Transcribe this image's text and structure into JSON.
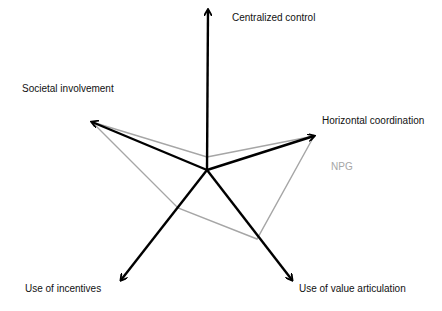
{
  "diagram": {
    "type": "radar-arrow-diagram",
    "center": [
      207,
      170
    ],
    "axes": [
      {
        "id": "centralized-control",
        "label": "Centralized control",
        "tip": [
          208,
          10
        ],
        "label_pos": [
          232,
          12
        ]
      },
      {
        "id": "horizontal-coordination",
        "label": "Horizontal coordination",
        "tip": [
          314,
          136
        ],
        "label_pos": [
          322,
          115
        ]
      },
      {
        "id": "use-of-value-articulation",
        "label": "Use of value articulation",
        "tip": [
          292,
          280
        ],
        "label_pos": [
          299,
          283
        ]
      },
      {
        "id": "use-of-incentives",
        "label": "Use of incentives",
        "tip": [
          121,
          280
        ],
        "label_pos": [
          25,
          283
        ]
      },
      {
        "id": "societal-involvement",
        "label": "Societal involvement",
        "tip": [
          92,
          122
        ],
        "label_pos": [
          22,
          83
        ]
      }
    ],
    "series": [
      {
        "name": "NPG",
        "color": "#a6a6a6",
        "points": [
          [
            207,
            157
          ],
          [
            314,
            136
          ],
          [
            257,
            239
          ],
          [
            178,
            208
          ],
          [
            92,
            122
          ]
        ],
        "label_pos": [
          331,
          161
        ]
      }
    ],
    "axis_color": "#000000"
  }
}
